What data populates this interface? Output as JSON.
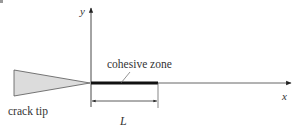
{
  "diagram": {
    "type": "cohesive-zone-model",
    "labels": {
      "y_axis": "y",
      "x_axis": "x",
      "cohesive_zone": "cohesive zone",
      "crack_tip": "crack tip",
      "length": "L"
    },
    "colors": {
      "line": "#333333",
      "crack_fill": "#dcdcdc",
      "cohesive_bar": "#111111",
      "corner_mark": "#999999"
    }
  }
}
